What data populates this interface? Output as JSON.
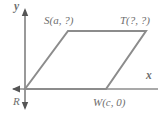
{
  "figure": {
    "kind": "coordinate-geometry-diagram",
    "shape": "parallelogram",
    "background_color": "#ffffff",
    "axis_color": "#555555",
    "shape_line_color": "#8c8c8c",
    "label_color": "#6e6e6e"
  },
  "axes": {
    "x_label": "x",
    "y_label": "y",
    "origin_px": [
      25,
      89
    ],
    "x_axis_from_px": [
      13,
      89
    ],
    "x_axis_to_px": [
      158,
      89
    ],
    "y_axis_from_px": [
      25,
      10
    ],
    "y_axis_to_px": [
      25,
      108
    ],
    "x_arrow_direction": "left",
    "y_arrow_direction": "down"
  },
  "vertices": [
    {
      "name": "R",
      "label": "R",
      "coords_text": "",
      "px": [
        25,
        89
      ]
    },
    {
      "name": "S",
      "label": "S",
      "coords_text": "(a, ?)",
      "px": [
        68,
        31
      ]
    },
    {
      "name": "T",
      "label": "T",
      "coords_text": "(?, ?)",
      "px": [
        146,
        31
      ]
    },
    {
      "name": "W",
      "label": "W",
      "coords_text": "(c, 0)",
      "px": [
        106,
        89
      ]
    }
  ],
  "labels": {
    "s": "S(a, ?)",
    "t": "T(?, ?)",
    "w": "W(c, 0)",
    "r": "R",
    "x": "x",
    "y": "y"
  }
}
